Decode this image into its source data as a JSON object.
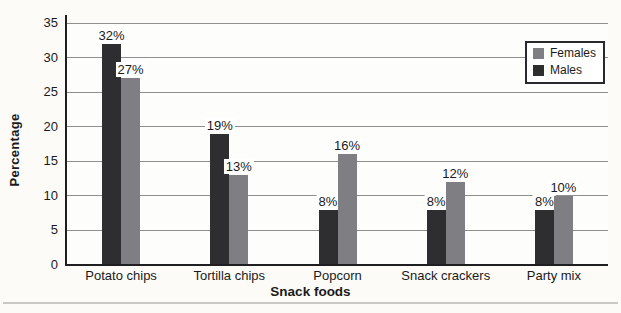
{
  "chart_data": {
    "type": "bar",
    "title": "",
    "xlabel": "Snack foods",
    "ylabel": "Percentage",
    "ylim": [
      0,
      35
    ],
    "yticks": [
      0,
      5,
      10,
      15,
      20,
      25,
      30,
      35
    ],
    "grid": true,
    "legend_position": "top-right",
    "categories": [
      "Potato chips",
      "Tortilla chips",
      "Popcorn",
      "Snack crackers",
      "Party mix"
    ],
    "series": [
      {
        "name": "Males",
        "color": "#2e2e31",
        "values": [
          32,
          19,
          8,
          8,
          8
        ],
        "data_labels": [
          "32%",
          "19%",
          "8%",
          "8%",
          "8%"
        ]
      },
      {
        "name": "Females",
        "color": "#7e7e83",
        "values": [
          27,
          13,
          16,
          12,
          10
        ],
        "data_labels": [
          "27%",
          "13%",
          "16%",
          "12%",
          "10%"
        ]
      }
    ],
    "legend": [
      {
        "label": "Females",
        "color": "#7e7e83"
      },
      {
        "label": "Males",
        "color": "#2e2e31"
      }
    ]
  },
  "style": {
    "gridline_color": "#8f8f8f",
    "axis_color": "#1f1f22",
    "text_color": "#1a1a1a",
    "page_background": "#fcfbf8",
    "plot_background": "#fdfdfc",
    "bottom_rule_color": "#c9c8c4"
  }
}
